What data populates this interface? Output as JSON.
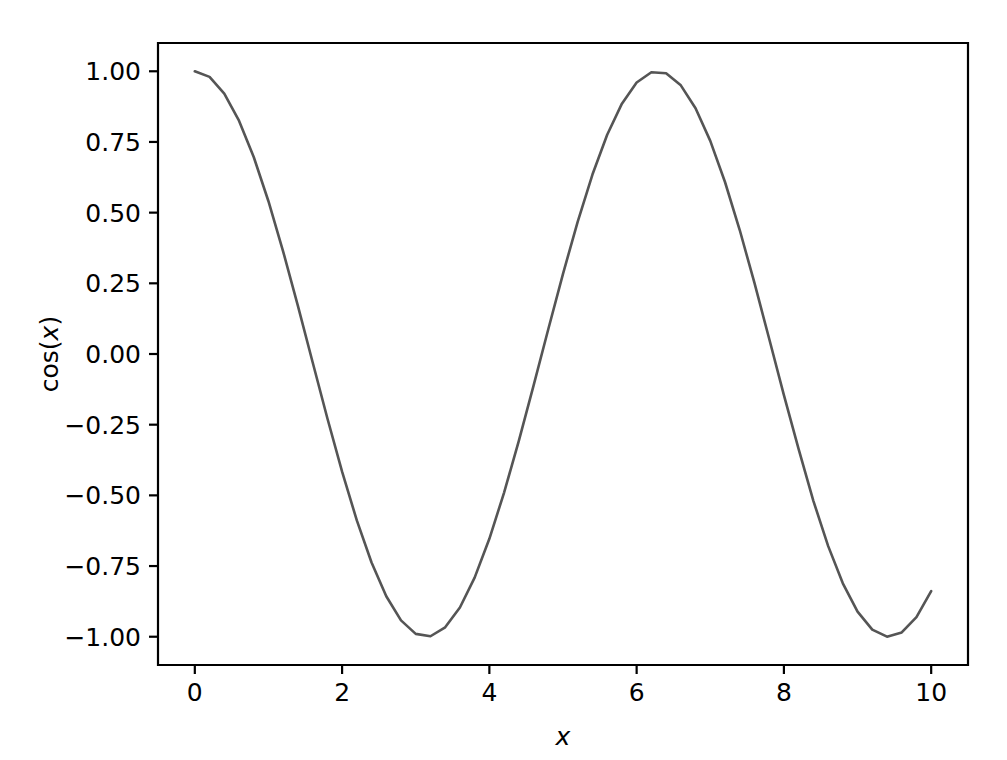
{
  "chart_data": {
    "type": "line",
    "title": "",
    "xlabel": "x",
    "ylabel": "cos(x)",
    "xlim": [
      -0.5,
      10.5
    ],
    "ylim": [
      -1.1,
      1.1
    ],
    "xticks": [
      0,
      2,
      4,
      6,
      8,
      10
    ],
    "xtick_labels": [
      "0",
      "2",
      "4",
      "6",
      "8",
      "10"
    ],
    "yticks": [
      -1.0,
      -0.75,
      -0.5,
      -0.25,
      0.0,
      0.25,
      0.5,
      0.75,
      1.0
    ],
    "ytick_labels": [
      "−1.00",
      "−0.75",
      "−0.50",
      "−0.25",
      "0.00",
      "0.25",
      "0.50",
      "0.75",
      "1.00"
    ],
    "grid": false,
    "legend": false,
    "line_color": "#555555",
    "line_width": 2.6,
    "background_color": "#ffffff",
    "spine_color": "#000000",
    "series": [
      {
        "name": "cos(x)",
        "x": [
          0.0,
          0.2,
          0.4,
          0.6,
          0.8,
          1.0,
          1.2,
          1.4,
          1.6,
          1.8,
          2.0,
          2.2,
          2.4,
          2.6,
          2.8,
          3.0,
          3.2,
          3.4,
          3.6,
          3.8,
          4.0,
          4.2,
          4.4,
          4.6,
          4.8,
          5.0,
          5.2,
          5.4,
          5.6,
          5.8,
          6.0,
          6.2,
          6.4,
          6.6,
          6.8,
          7.0,
          7.2,
          7.4,
          7.6,
          7.8,
          8.0,
          8.2,
          8.4,
          8.6,
          8.8,
          9.0,
          9.2,
          9.4,
          9.6,
          9.8,
          10.0
        ],
        "y": [
          1.0,
          0.98007,
          0.92106,
          0.82534,
          0.69671,
          0.5403,
          0.36236,
          0.16997,
          -0.0292,
          -0.2272,
          -0.41615,
          -0.5885,
          -0.73739,
          -0.85689,
          -0.94222,
          -0.98999,
          -0.99829,
          -0.9668,
          -0.89676,
          -0.79097,
          -0.65364,
          -0.49026,
          -0.30733,
          -0.11215,
          0.0875,
          0.28366,
          0.46852,
          0.63469,
          0.77557,
          0.88552,
          0.96017,
          0.99654,
          0.99318,
          0.95024,
          0.86939,
          0.7539,
          0.60835,
          0.43855,
          0.25126,
          0.05395,
          -0.1455,
          -0.33646,
          -0.51929,
          -0.6787,
          -0.81109,
          -0.91113,
          -0.97484,
          -0.99966,
          -0.98469,
          -0.93042,
          -0.83907
        ]
      }
    ]
  },
  "axes": {
    "y_axis_title": "cos(x)",
    "x_axis_title": "x"
  }
}
